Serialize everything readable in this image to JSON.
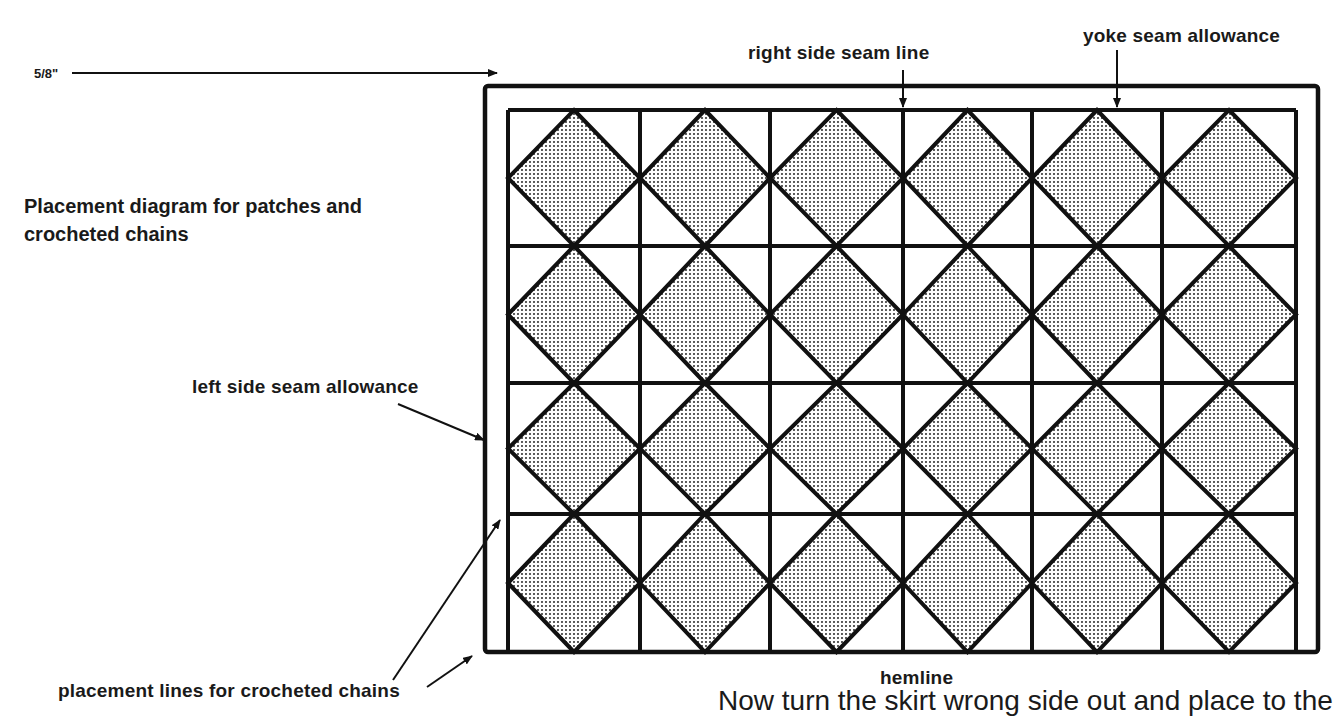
{
  "diagram": {
    "title": "Placement diagram for patches and crocheted chains",
    "title_lines": [
      "Placement diagram for patches and",
      "crocheted chains"
    ],
    "labels": {
      "right_side_seam_line": "right side seam line",
      "yoke_seam_allowance": "yoke seam allowance",
      "seam_allowance_width": "5/8\"",
      "left_side_seam_allowance": "left side seam allowance",
      "placement_lines": "placement lines for crocheted chains",
      "hemline": "hemline"
    },
    "clipped_text": "Now turn the skirt wrong side out and place to the",
    "grid": {
      "columns": 6,
      "rows": 4,
      "patch_shape": "diamond",
      "patch_fill": "stippled gray",
      "patch_count": 24
    },
    "colors": {
      "line": "#111111",
      "patch_fill": "#cfcfcf",
      "background": "#ffffff"
    }
  }
}
